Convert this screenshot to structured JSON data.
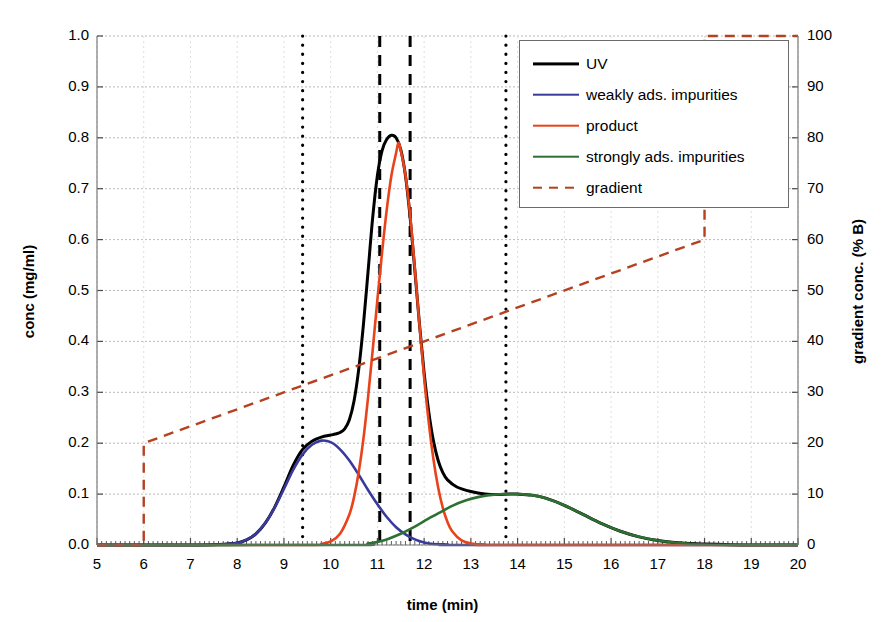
{
  "chart_data": {
    "type": "line",
    "title": "",
    "xlabel": "time (min)",
    "ylabel": "conc (mg/ml)",
    "ylabel_right": "gradient conc. (% B)",
    "xlim": [
      5,
      20
    ],
    "ylim": [
      0.0,
      1.0
    ],
    "ylim_right": [
      0,
      100
    ],
    "grid": true,
    "legend_position": "upper right",
    "x_ticks": [
      "5",
      "6",
      "7",
      "8",
      "9",
      "10",
      "11",
      "12",
      "13",
      "14",
      "15",
      "16",
      "17",
      "18",
      "19",
      "20"
    ],
    "y_ticks_left": [
      "0.0",
      "0.1",
      "0.2",
      "0.3",
      "0.4",
      "0.5",
      "0.6",
      "0.7",
      "0.8",
      "0.9",
      "1.0"
    ],
    "y_ticks_right": [
      "0",
      "10",
      "20",
      "30",
      "40",
      "50",
      "60",
      "70",
      "80",
      "90",
      "100"
    ],
    "x_minor_tick_interval": 0.1,
    "series": [
      {
        "name": "UV",
        "color": "#000000",
        "style": "solid",
        "width": 3.0,
        "axis": "left",
        "note": "sum of the three component peaks",
        "points": [
          [
            5.0,
            0.0
          ],
          [
            6.0,
            0.0
          ],
          [
            7.0,
            0.0
          ],
          [
            7.6,
            0.001
          ],
          [
            8.0,
            0.004
          ],
          [
            8.2,
            0.01
          ],
          [
            8.4,
            0.022
          ],
          [
            8.6,
            0.043
          ],
          [
            8.8,
            0.074
          ],
          [
            9.0,
            0.114
          ],
          [
            9.2,
            0.157
          ],
          [
            9.4,
            0.188
          ],
          [
            9.6,
            0.204
          ],
          [
            9.8,
            0.212
          ],
          [
            10.0,
            0.216
          ],
          [
            10.1,
            0.218
          ],
          [
            10.2,
            0.221
          ],
          [
            10.3,
            0.228
          ],
          [
            10.4,
            0.246
          ],
          [
            10.5,
            0.283
          ],
          [
            10.6,
            0.345
          ],
          [
            10.7,
            0.432
          ],
          [
            10.8,
            0.537
          ],
          [
            10.9,
            0.644
          ],
          [
            11.0,
            0.726
          ],
          [
            11.1,
            0.775
          ],
          [
            11.2,
            0.797
          ],
          [
            11.3,
            0.805
          ],
          [
            11.4,
            0.8
          ],
          [
            11.5,
            0.777
          ],
          [
            11.6,
            0.726
          ],
          [
            11.7,
            0.644
          ],
          [
            11.8,
            0.541
          ],
          [
            11.9,
            0.434
          ],
          [
            12.0,
            0.338
          ],
          [
            12.1,
            0.261
          ],
          [
            12.2,
            0.204
          ],
          [
            12.3,
            0.166
          ],
          [
            12.4,
            0.142
          ],
          [
            12.5,
            0.128
          ],
          [
            12.7,
            0.114
          ],
          [
            13.0,
            0.105
          ],
          [
            13.3,
            0.1
          ],
          [
            13.6,
            0.099
          ],
          [
            13.8,
            0.1
          ],
          [
            14.0,
            0.1
          ],
          [
            14.3,
            0.098
          ],
          [
            14.6,
            0.092
          ],
          [
            15.0,
            0.078
          ],
          [
            15.4,
            0.06
          ],
          [
            15.8,
            0.042
          ],
          [
            16.2,
            0.027
          ],
          [
            16.6,
            0.016
          ],
          [
            17.0,
            0.009
          ],
          [
            17.5,
            0.004
          ],
          [
            18.0,
            0.002
          ],
          [
            19.0,
            0.0
          ],
          [
            20.0,
            0.0
          ]
        ]
      },
      {
        "name": "weakly ads. impurities",
        "color": "#3a3a9c",
        "style": "solid",
        "width": 2.6,
        "axis": "left",
        "peak_center": 9.85,
        "peak_height": 0.205,
        "points": [
          [
            5.0,
            0.0
          ],
          [
            7.2,
            0.0
          ],
          [
            7.8,
            0.002
          ],
          [
            8.0,
            0.004
          ],
          [
            8.2,
            0.01
          ],
          [
            8.4,
            0.022
          ],
          [
            8.6,
            0.043
          ],
          [
            8.8,
            0.073
          ],
          [
            9.0,
            0.11
          ],
          [
            9.2,
            0.148
          ],
          [
            9.4,
            0.178
          ],
          [
            9.6,
            0.197
          ],
          [
            9.8,
            0.205
          ],
          [
            10.0,
            0.202
          ],
          [
            10.2,
            0.188
          ],
          [
            10.4,
            0.166
          ],
          [
            10.6,
            0.138
          ],
          [
            10.8,
            0.108
          ],
          [
            11.0,
            0.08
          ],
          [
            11.2,
            0.055
          ],
          [
            11.4,
            0.035
          ],
          [
            11.6,
            0.021
          ],
          [
            11.8,
            0.011
          ],
          [
            12.0,
            0.005
          ],
          [
            12.2,
            0.002
          ],
          [
            12.5,
            0.001
          ],
          [
            13.0,
            0.0
          ],
          [
            20.0,
            0.0
          ]
        ]
      },
      {
        "name": "product",
        "color": "#e8431a",
        "style": "solid",
        "width": 2.6,
        "axis": "left",
        "peak_center": 11.45,
        "peak_height": 0.79,
        "points": [
          [
            5.0,
            0.0
          ],
          [
            9.5,
            0.0
          ],
          [
            9.8,
            0.002
          ],
          [
            10.0,
            0.007
          ],
          [
            10.2,
            0.022
          ],
          [
            10.4,
            0.06
          ],
          [
            10.5,
            0.094
          ],
          [
            10.6,
            0.143
          ],
          [
            10.7,
            0.208
          ],
          [
            10.8,
            0.29
          ],
          [
            10.9,
            0.384
          ],
          [
            11.0,
            0.482
          ],
          [
            11.1,
            0.575
          ],
          [
            11.2,
            0.659
          ],
          [
            11.3,
            0.726
          ],
          [
            11.4,
            0.77
          ],
          [
            11.45,
            0.79
          ],
          [
            11.5,
            0.775
          ],
          [
            11.6,
            0.727
          ],
          [
            11.7,
            0.648
          ],
          [
            11.8,
            0.544
          ],
          [
            11.9,
            0.433
          ],
          [
            12.0,
            0.329
          ],
          [
            12.1,
            0.24
          ],
          [
            12.2,
            0.168
          ],
          [
            12.3,
            0.113
          ],
          [
            12.4,
            0.073
          ],
          [
            12.5,
            0.045
          ],
          [
            12.6,
            0.027
          ],
          [
            12.8,
            0.009
          ],
          [
            13.0,
            0.003
          ],
          [
            13.3,
            0.001
          ],
          [
            13.7,
            0.0
          ],
          [
            20.0,
            0.0
          ]
        ]
      },
      {
        "name": "strongly ads. impurities",
        "color": "#2e7032",
        "style": "solid",
        "width": 2.6,
        "axis": "left",
        "peak_center": 14.0,
        "peak_height": 0.1,
        "points": [
          [
            5.0,
            0.0
          ],
          [
            10.4,
            0.0
          ],
          [
            10.8,
            0.003
          ],
          [
            11.0,
            0.006
          ],
          [
            11.2,
            0.011
          ],
          [
            11.5,
            0.022
          ],
          [
            11.8,
            0.036
          ],
          [
            12.0,
            0.047
          ],
          [
            12.3,
            0.062
          ],
          [
            12.6,
            0.077
          ],
          [
            12.9,
            0.088
          ],
          [
            13.2,
            0.095
          ],
          [
            13.5,
            0.099
          ],
          [
            13.8,
            0.1
          ],
          [
            14.0,
            0.1
          ],
          [
            14.3,
            0.098
          ],
          [
            14.6,
            0.092
          ],
          [
            15.0,
            0.078
          ],
          [
            15.4,
            0.06
          ],
          [
            15.8,
            0.042
          ],
          [
            16.2,
            0.027
          ],
          [
            16.6,
            0.016
          ],
          [
            17.0,
            0.009
          ],
          [
            17.5,
            0.004
          ],
          [
            18.0,
            0.001
          ],
          [
            18.6,
            0.0
          ],
          [
            20.0,
            0.0
          ]
        ]
      },
      {
        "name": "gradient",
        "color": "#b4411f",
        "style": "dashed",
        "width": 2.4,
        "axis": "right",
        "points": [
          [
            5.0,
            0
          ],
          [
            6.0,
            0
          ],
          [
            6.0,
            20
          ],
          [
            18.0,
            60
          ],
          [
            18.0,
            100
          ],
          [
            20.0,
            100
          ]
        ]
      }
    ],
    "marker_lines": [
      {
        "name": "cut-start-outer",
        "x": 9.4,
        "style": "dotted",
        "color": "#000000",
        "width": 3.2
      },
      {
        "name": "cut-start-inner",
        "x": 11.05,
        "style": "dashed",
        "color": "#000000",
        "width": 3.0
      },
      {
        "name": "cut-end-inner",
        "x": 11.7,
        "style": "dashed",
        "color": "#000000",
        "width": 3.0
      },
      {
        "name": "cut-end-outer",
        "x": 13.75,
        "style": "dotted",
        "color": "#000000",
        "width": 3.2
      }
    ]
  },
  "legend": {
    "items": [
      {
        "label": "UV",
        "color": "#000000",
        "style": "solid",
        "width": 3.2
      },
      {
        "label": "weakly ads. impurities",
        "color": "#3a3a9c",
        "style": "solid",
        "width": 2.6
      },
      {
        "label": "product",
        "color": "#e8431a",
        "style": "solid",
        "width": 2.6
      },
      {
        "label": "strongly ads. impurities",
        "color": "#2e7032",
        "style": "solid",
        "width": 2.6
      },
      {
        "label": "gradient",
        "color": "#b4411f",
        "style": "dashed",
        "width": 2.6
      }
    ]
  }
}
